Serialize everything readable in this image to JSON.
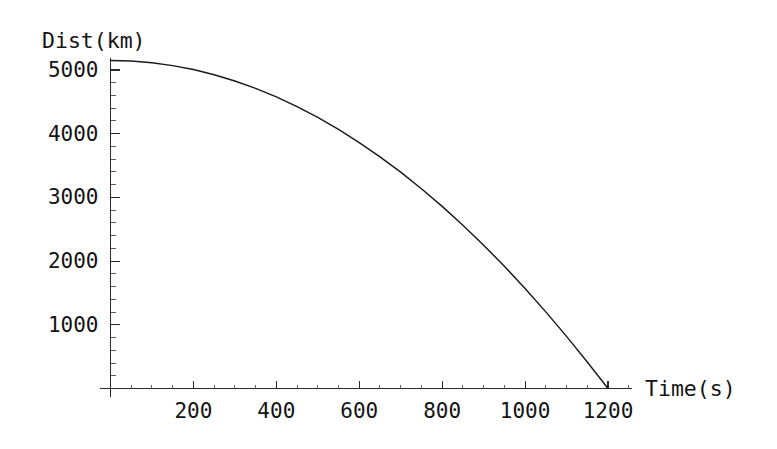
{
  "chart_data": {
    "type": "line",
    "title": "",
    "subtitle": "",
    "xlabel": "Time(s)",
    "ylabel": "Dist(km)",
    "xlim": [
      0,
      1300
    ],
    "ylim": [
      0,
      5400
    ],
    "grid": false,
    "legend": null,
    "annotations": [],
    "x_ticks_major": [
      200,
      400,
      600,
      800,
      1000,
      1200
    ],
    "x_tick_labels": [
      "200",
      "400",
      "600",
      "800",
      "1000",
      "1200"
    ],
    "x_minor_step": 50,
    "y_ticks_major": [
      1000,
      2000,
      3000,
      4000,
      5000
    ],
    "y_tick_labels": [
      "1000",
      "2000",
      "3000",
      "4000",
      "5000"
    ],
    "y_minor_step": 200,
    "series": [
      {
        "name": "distance",
        "color": "#1a1a1a",
        "x": [
          0,
          50,
          100,
          150,
          200,
          250,
          300,
          350,
          400,
          450,
          500,
          550,
          600,
          650,
          700,
          750,
          800,
          850,
          900,
          950,
          1000,
          1050,
          1100,
          1150,
          1200
        ],
        "values": [
          5150,
          5141,
          5114,
          5069,
          5007,
          4926,
          4828,
          4712,
          4578,
          4425,
          4255,
          4067,
          3861,
          3637,
          3396,
          3136,
          2859,
          2563,
          2250,
          1919,
          1570,
          1203,
          818,
          416,
          0
        ]
      }
    ]
  },
  "axes": {
    "y_axis_title": "Dist(km)",
    "x_axis_title": "Time(s)"
  }
}
